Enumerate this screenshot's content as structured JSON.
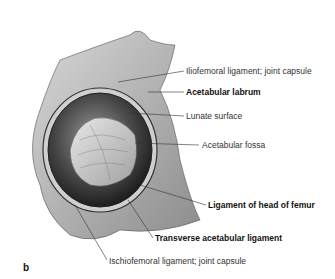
{
  "figure": {
    "panel_letter": "b",
    "labels": [
      {
        "text": "Iliofemoral ligament; joint capsule",
        "bold": false
      },
      {
        "text": "Acetabular labrum",
        "bold": true
      },
      {
        "text": "Lunate surface",
        "bold": false
      },
      {
        "text": "Acetabular fossa",
        "bold": false
      },
      {
        "text": "Ligament of head of femur",
        "bold": true
      },
      {
        "text": "Transverse acetabular ligament",
        "bold": true
      },
      {
        "text": "Ischiofemoral ligament; joint capsule",
        "bold": false
      }
    ]
  }
}
